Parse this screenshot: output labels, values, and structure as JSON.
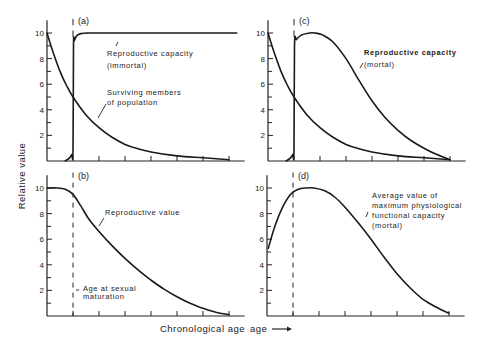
{
  "figure": {
    "ylabel": "Relative value",
    "xlabel": "Chronological age",
    "xlabel_arrow": "⟶"
  },
  "chart_data": [
    {
      "id": "a",
      "type": "line",
      "panel_label": "(a)",
      "xlabel": "Chronological age",
      "ylabel": "Relative value",
      "ylim": [
        0,
        10
      ],
      "xlim": [
        0,
        7.5
      ],
      "yticks": [
        2,
        4,
        6,
        8,
        10
      ],
      "minor_yticks": [
        1,
        3,
        5,
        7,
        9
      ],
      "xticks": [
        1,
        2,
        3,
        4,
        5,
        6,
        7
      ],
      "grid": false,
      "maturation_x": 1,
      "series": [
        {
          "name": "Reproductive capacity (immortal)",
          "x": [
            0.7,
            0.85,
            0.95,
            1.0,
            1.02,
            1.05,
            1.15,
            1.3,
            1.6,
            2.0,
            7.3
          ],
          "y": [
            0,
            0.2,
            0.5,
            0.8,
            9.0,
            9.4,
            9.8,
            9.95,
            10,
            10,
            10
          ]
        },
        {
          "name": "Surviving members of population",
          "x": [
            0,
            0.25,
            0.5,
            0.75,
            1.0,
            1.5,
            2.0,
            2.5,
            3.0,
            3.5,
            4.0,
            5.0,
            6.0,
            7.0
          ],
          "y": [
            10,
            8.4,
            7.0,
            5.9,
            5.0,
            3.6,
            2.6,
            1.85,
            1.3,
            0.95,
            0.7,
            0.4,
            0.25,
            0.1
          ]
        }
      ],
      "annotations": [
        {
          "text": "Reproductive capacity",
          "line2": "(immortal)"
        },
        {
          "text": "Surviving members",
          "line2": "of population"
        }
      ]
    },
    {
      "id": "b",
      "type": "line",
      "panel_label": "(b)",
      "ylim": [
        0,
        10
      ],
      "xlim": [
        0,
        7.5
      ],
      "yticks": [
        2,
        4,
        6,
        8,
        10
      ],
      "minor_yticks": [
        1,
        3,
        5,
        7,
        9
      ],
      "xticks": [
        1,
        2,
        3,
        4,
        5,
        6,
        7
      ],
      "grid": false,
      "maturation_x": 1,
      "series": [
        {
          "name": "Reproductive value",
          "x": [
            0,
            0.4,
            0.7,
            1.0,
            1.3,
            1.6,
            2.0,
            2.5,
            3.0,
            3.5,
            4.0,
            4.5,
            5.0,
            5.5,
            6.0,
            6.5,
            7.0
          ],
          "y": [
            10,
            10,
            9.9,
            9.5,
            8.6,
            7.6,
            6.6,
            5.5,
            4.5,
            3.6,
            2.8,
            2.1,
            1.5,
            1.0,
            0.6,
            0.3,
            0.1
          ]
        }
      ],
      "annotations": [
        {
          "text": "Reproductive value"
        },
        {
          "text": "Age at sexual",
          "line2": "maturation"
        }
      ]
    },
    {
      "id": "c",
      "type": "line",
      "panel_label": "(c)",
      "ylim": [
        0,
        10
      ],
      "xlim": [
        0,
        7.5
      ],
      "yticks": [
        2,
        4,
        6,
        8,
        10
      ],
      "minor_yticks": [
        1,
        3,
        5,
        7,
        9
      ],
      "xticks": [
        1,
        2,
        3,
        4,
        5,
        6,
        7
      ],
      "grid": false,
      "maturation_x": 1,
      "series": [
        {
          "name": "Reproductive capacity (mortal)",
          "x": [
            0.7,
            0.85,
            0.95,
            1.0,
            1.02,
            1.1,
            1.3,
            1.6,
            1.8,
            2.1,
            2.5,
            3.0,
            3.5,
            4.0,
            4.5,
            5.0,
            5.5,
            6.0,
            6.5,
            7.0
          ],
          "y": [
            0,
            0.2,
            0.5,
            0.8,
            9.0,
            9.5,
            9.85,
            10,
            10,
            9.85,
            9.3,
            8.0,
            6.3,
            4.7,
            3.4,
            2.4,
            1.6,
            1.0,
            0.5,
            0.1
          ]
        },
        {
          "name": "Surviving members of population",
          "x": [
            0,
            0.25,
            0.5,
            0.75,
            1.0,
            1.5,
            2.0,
            2.5,
            3.0,
            3.5,
            4.0,
            5.0,
            6.0,
            7.0
          ],
          "y": [
            10,
            8.4,
            7.0,
            5.9,
            5.0,
            3.6,
            2.6,
            1.85,
            1.3,
            0.95,
            0.7,
            0.4,
            0.25,
            0.1
          ]
        }
      ],
      "annotations": [
        {
          "text": "Reproductive capacity",
          "line2": "(mortal)"
        }
      ]
    },
    {
      "id": "d",
      "type": "line",
      "panel_label": "(d)",
      "ylim": [
        0,
        10
      ],
      "xlim": [
        0,
        7.5
      ],
      "yticks": [
        2,
        4,
        6,
        8,
        10
      ],
      "minor_yticks": [
        1,
        3,
        5,
        7,
        9
      ],
      "xticks": [
        1,
        2,
        3,
        4,
        5,
        6,
        7
      ],
      "grid": false,
      "maturation_x": 1,
      "series": [
        {
          "name": "Average value of maximum physiological functional capacity (mortal)",
          "x": [
            0.05,
            0.3,
            0.6,
            0.9,
            1.2,
            1.5,
            1.8,
            2.2,
            2.6,
            3.0,
            3.5,
            4.0,
            4.5,
            5.0,
            5.5,
            6.0,
            6.5,
            7.0
          ],
          "y": [
            5.3,
            7.0,
            8.5,
            9.5,
            9.9,
            10,
            10,
            9.8,
            9.3,
            8.5,
            7.3,
            6.0,
            4.6,
            3.3,
            2.2,
            1.3,
            0.7,
            0.2
          ]
        }
      ],
      "annotations": [
        {
          "text": "Average value of",
          "line2": "maximum physiological",
          "line3": "functional capacity",
          "line4": "(mortal)"
        }
      ]
    }
  ]
}
